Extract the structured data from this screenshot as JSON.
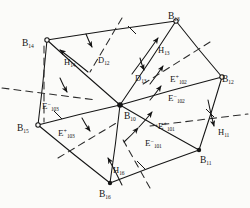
{
  "figure": {
    "type": "diagram",
    "title": "",
    "width": 250,
    "height": 208,
    "background_color": "#fbfbf9",
    "ink_color": "#151515"
  },
  "nodes": [
    {
      "id": "B14",
      "base": "B",
      "sub": "14",
      "x": 47,
      "y": 40,
      "label_x": 22,
      "label_y": 33,
      "marker": "open-circle"
    },
    {
      "id": "B13",
      "base": "B",
      "sub": "13",
      "x": 176,
      "y": 21,
      "label_x": 168,
      "label_y": 6,
      "marker": "open-circle"
    },
    {
      "id": "B12",
      "base": "B",
      "sub": "12",
      "x": 222,
      "y": 77,
      "label_x": 222,
      "label_y": 69,
      "marker": "open-circle"
    },
    {
      "id": "B11",
      "base": "B",
      "sub": "11",
      "x": 199,
      "y": 150,
      "label_x": 200,
      "label_y": 150,
      "marker": "filled-dot"
    },
    {
      "id": "B16",
      "base": "B",
      "sub": "16",
      "x": 110,
      "y": 183,
      "label_x": 99,
      "label_y": 184,
      "marker": "filled-dot"
    },
    {
      "id": "B15",
      "base": "B",
      "sub": "15",
      "x": 38,
      "y": 125,
      "label_x": 17,
      "label_y": 118,
      "marker": "open-circle"
    },
    {
      "id": "B10",
      "base": "B",
      "sub": "10",
      "x": 120,
      "y": 105,
      "label_x": 124,
      "label_y": 106,
      "marker": "filled-dot"
    }
  ],
  "edges": [
    {
      "from": "B14",
      "to": "B13"
    },
    {
      "from": "B13",
      "to": "B12"
    },
    {
      "from": "B12",
      "to": "B11"
    },
    {
      "from": "B11",
      "to": "B16"
    },
    {
      "from": "B16",
      "to": "B15"
    },
    {
      "from": "B15",
      "to": "B14"
    },
    {
      "from": "B10",
      "to": "B14"
    },
    {
      "from": "B10",
      "to": "B13"
    },
    {
      "from": "B10",
      "to": "B12"
    },
    {
      "from": "B10",
      "to": "B11"
    },
    {
      "from": "B10",
      "to": "B16"
    },
    {
      "from": "B10",
      "to": "B15"
    }
  ],
  "field_labels": [
    {
      "id": "E102p",
      "base": "E",
      "sup": "+",
      "sub": "102",
      "x": 170,
      "y": 69
    },
    {
      "id": "E102m",
      "base": "E",
      "sup": "−",
      "sub": "102",
      "x": 168,
      "y": 88
    },
    {
      "id": "E101p",
      "base": "E",
      "sup": "+",
      "sub": "101",
      "x": 158,
      "y": 116
    },
    {
      "id": "E101m",
      "base": "E",
      "sup": "−",
      "sub": "101",
      "x": 145,
      "y": 133
    },
    {
      "id": "E103m",
      "base": "E",
      "sup": "−",
      "sub": "103",
      "x": 42,
      "y": 96
    },
    {
      "id": "E103p",
      "base": "E",
      "sup": "+",
      "sub": "103",
      "x": 58,
      "y": 123
    }
  ],
  "h_labels": [
    {
      "id": "H14",
      "base": "H",
      "sub": "14",
      "x": 64,
      "y": 52
    },
    {
      "id": "H13",
      "base": "H",
      "sub": "13",
      "x": 158,
      "y": 40
    },
    {
      "id": "H11",
      "base": "H",
      "sub": "11",
      "x": 218,
      "y": 122
    },
    {
      "id": "H16",
      "base": "H",
      "sub": "16",
      "x": 113,
      "y": 160
    }
  ],
  "d_labels": [
    {
      "id": "D12",
      "base": "D",
      "sub": "12",
      "x": 98,
      "y": 50
    },
    {
      "id": "D13",
      "base": "D",
      "sub": "13",
      "x": 135,
      "y": 68
    }
  ],
  "arrows": [
    {
      "id": "arrow-H14",
      "x1": 88,
      "y1": 72,
      "x2": 60,
      "y2": 50
    },
    {
      "id": "arrow-H13",
      "x1": 132,
      "y1": 74,
      "x2": 158,
      "y2": 38
    },
    {
      "id": "arrow-H16",
      "x1": 122,
      "y1": 185,
      "x2": 108,
      "y2": 158
    },
    {
      "id": "arrow-H11",
      "x1": 208,
      "y1": 100,
      "x2": 214,
      "y2": 126
    },
    {
      "id": "arrow-E102p",
      "x1": 150,
      "y1": 84,
      "x2": 163,
      "y2": 66
    },
    {
      "id": "arrow-E102m",
      "x1": 150,
      "y1": 100,
      "x2": 161,
      "y2": 86
    },
    {
      "id": "arrow-E101p",
      "x1": 139,
      "y1": 127,
      "x2": 152,
      "y2": 112
    },
    {
      "id": "arrow-E101m",
      "x1": 124,
      "y1": 142,
      "x2": 138,
      "y2": 128
    },
    {
      "id": "arrow-E103m",
      "x1": 60,
      "y1": 78,
      "x2": 67,
      "y2": 92
    },
    {
      "id": "arrow-E103p",
      "x1": 82,
      "y1": 118,
      "x2": 90,
      "y2": 131
    },
    {
      "id": "arrow-D12",
      "x1": 86,
      "y1": 34,
      "x2": 92,
      "y2": 47
    },
    {
      "id": "arrow-D13",
      "x1": 140,
      "y1": 58,
      "x2": 144,
      "y2": 70
    }
  ],
  "dashed_lines": [
    {
      "id": "dash-upper-left",
      "x1": 122,
      "y1": 18,
      "x2": 90,
      "y2": 72
    },
    {
      "id": "dash-upper-right",
      "x1": 210,
      "y1": 42,
      "x2": 140,
      "y2": 86
    },
    {
      "id": "dash-left",
      "x1": 2,
      "y1": 88,
      "x2": 96,
      "y2": 100
    },
    {
      "id": "dash-right",
      "x1": 150,
      "y1": 126,
      "x2": 248,
      "y2": 114
    },
    {
      "id": "dash-lower-left",
      "x1": 58,
      "y1": 158,
      "x2": 118,
      "y2": 122
    },
    {
      "id": "dash-lower-right",
      "x1": 150,
      "y1": 188,
      "x2": 122,
      "y2": 138
    },
    {
      "id": "dash-vertical-left",
      "x1": 44,
      "y1": 46,
      "x2": 44,
      "y2": 122
    }
  ],
  "tick_marks": [
    {
      "id": "tick-top",
      "x": 132,
      "y": 30
    },
    {
      "id": "tick-right",
      "x": 210,
      "y": 113
    },
    {
      "id": "tick-left",
      "x": 58,
      "y": 115
    },
    {
      "id": "tick-bottom",
      "x": 141,
      "y": 165
    }
  ]
}
